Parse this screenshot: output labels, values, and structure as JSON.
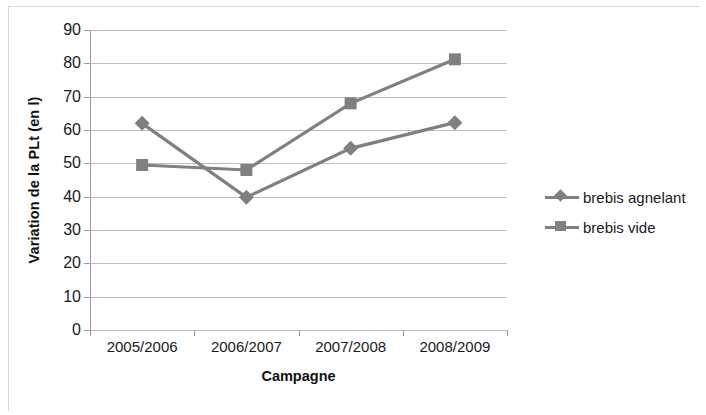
{
  "chart_data": {
    "type": "line",
    "title": "",
    "xlabel": "Campagne",
    "ylabel": "Variation de la PLt (en l)",
    "categories": [
      "2005/2006",
      "2006/2007",
      "2007/2008",
      "2008/2009"
    ],
    "series": [
      {
        "name": "brebis agnelant",
        "marker": "diamond",
        "color": "#808080",
        "values": [
          62,
          39.8,
          54.5,
          62.2
        ]
      },
      {
        "name": "brebis vide",
        "marker": "square",
        "color": "#808080",
        "values": [
          49.5,
          48,
          68,
          81.2
        ]
      }
    ],
    "ylim": [
      0,
      90
    ],
    "yticks": [
      0,
      10,
      20,
      30,
      40,
      50,
      60,
      70,
      80,
      90
    ],
    "ytick_labels": [
      "0",
      "10",
      "20",
      "30",
      "40",
      "50",
      "60",
      "70",
      "80",
      "90"
    ],
    "grid": true,
    "grid_axis": "y",
    "legend_position": "right",
    "line_color": "#808080",
    "grid_color": "#bfbfbf",
    "axis_color": "#9a9a9a",
    "background": "#ffffff"
  },
  "legend": {
    "entries": [
      {
        "label": "brebis agnelant",
        "marker": "diamond"
      },
      {
        "label": "brebis vide",
        "marker": "square"
      }
    ]
  }
}
